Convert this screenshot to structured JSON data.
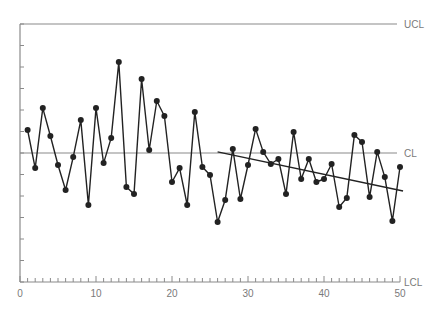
{
  "chart_data": {
    "type": "line",
    "title": "",
    "xlabel": "",
    "ylabel": "",
    "xlim": [
      0,
      50
    ],
    "ylim": [
      -6,
      6
    ],
    "x_ticks": [
      0,
      10,
      20,
      30,
      40,
      50
    ],
    "x_tick_labels": [
      "0",
      "10",
      "20",
      "30",
      "40",
      "50"
    ],
    "y_tick_step": 1,
    "grid": false,
    "legend": "none",
    "control_lines": [
      {
        "name": "UCL",
        "value": 6,
        "label": "UCL"
      },
      {
        "name": "CL",
        "value": 0,
        "label": "CL"
      },
      {
        "name": "LCL",
        "value": -6,
        "label": "LCL"
      }
    ],
    "series": [
      {
        "name": "samples",
        "x": [
          1,
          2,
          3,
          4,
          5,
          6,
          7,
          8,
          9,
          10,
          11,
          12,
          13,
          14,
          15,
          16,
          17,
          18,
          19,
          20,
          21,
          22,
          23,
          24,
          25,
          26,
          27,
          28,
          29,
          30,
          31,
          32,
          33,
          34,
          35,
          36,
          37,
          38,
          39,
          40,
          41,
          42,
          43,
          44,
          45,
          46,
          47,
          48,
          49,
          50
        ],
        "values": [
          1.07,
          -0.7,
          2.09,
          0.79,
          -0.56,
          -1.72,
          -0.19,
          1.53,
          -2.42,
          2.09,
          -0.47,
          0.7,
          4.23,
          -1.58,
          -1.91,
          3.44,
          0.14,
          2.42,
          1.72,
          -1.35,
          -0.7,
          -2.42,
          1.91,
          -0.65,
          -1.02,
          -3.21,
          -2.19,
          0.19,
          -2.14,
          -0.56,
          1.12,
          0.05,
          -0.51,
          -0.28,
          -1.91,
          0.98,
          -1.21,
          -0.28,
          -1.35,
          -1.21,
          -0.51,
          -2.51,
          -2.09,
          0.84,
          0.51,
          -2.05,
          0.05,
          -1.12,
          -3.16,
          -0.65
        ],
        "marker": "circle",
        "color": "#222222"
      }
    ],
    "annotations": [
      {
        "type": "trend_line",
        "from": [
          26,
          0.05
        ],
        "to": [
          50.4,
          -1.77
        ],
        "color": "#222222"
      }
    ]
  },
  "labels": {
    "ucl": "UCL",
    "cl": "CL",
    "lcl": "LCL"
  },
  "colors": {
    "axis": "#8a8a8a",
    "data": "#222222",
    "text": "#7a7a7a"
  }
}
